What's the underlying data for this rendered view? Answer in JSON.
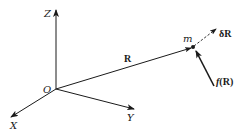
{
  "diagram": {
    "type": "3d-coordinate-vector-diagram",
    "colors": {
      "ink": "#1a1a1a",
      "background": "#ffffff"
    },
    "axes": {
      "origin_label": "O",
      "x_label": "X",
      "y_label": "Y",
      "z_label": "Z"
    },
    "vectors": {
      "position_label": "R",
      "displacement_label": "δR",
      "force_label_fn": "f",
      "force_label_arg": "(R)"
    },
    "point": {
      "mass_label": "m"
    }
  }
}
